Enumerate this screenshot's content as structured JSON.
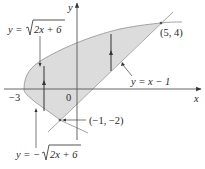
{
  "figure": {
    "region_fill": "#dcdcdc",
    "line_color": "#444444",
    "axes": {
      "x_label": "x",
      "y_label": "y",
      "origin_label": "0",
      "x_tick_label": "−3"
    },
    "curves": {
      "upper": {
        "label_prefix": "y = ",
        "label_root": "2x + 6",
        "equation": "y = √(2x + 6)"
      },
      "lower": {
        "label_prefix": "y = −",
        "label_root": "2x + 6",
        "equation": "y = −√(2x + 6)"
      },
      "line": {
        "label": "y = x − 1",
        "equation": "y = x − 1"
      }
    },
    "points": [
      {
        "label": "(5, 4)",
        "x": 5,
        "y": 4
      },
      {
        "label": "(−1, −2)",
        "x": -1,
        "y": -2
      }
    ]
  }
}
